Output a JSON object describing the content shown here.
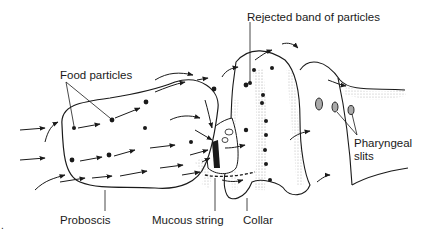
{
  "figure": {
    "labels": {
      "food_particles": "Food particles",
      "rejected_band": "Rejected band of particles",
      "pharyngeal_slits_line1": "Pharyngeal",
      "pharyngeal_slits_line2": "slits",
      "proboscis": "Proboscis",
      "mucous_string": "Mucous string",
      "collar": "Collar",
      "edge_fragment": "."
    },
    "icons": [
      "arrow-icon",
      "particle-icon"
    ],
    "colors": {
      "ink": "#1a1a1a",
      "stipple": "#9a9a9a",
      "background": "#ffffff"
    }
  }
}
